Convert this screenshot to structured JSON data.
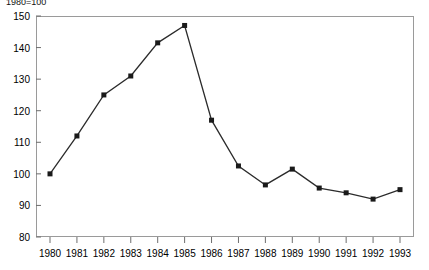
{
  "figure": {
    "index_note": "1980=100"
  },
  "chart_data": {
    "type": "line",
    "title": "",
    "subtitle": "",
    "annotations": [
      "1980=100"
    ],
    "xlabel": "",
    "ylabel": "",
    "categories": [
      "1980",
      "1981",
      "1982",
      "1983",
      "1984",
      "1985",
      "1986",
      "1987",
      "1988",
      "1989",
      "1990",
      "1991",
      "1992",
      "1993"
    ],
    "values": [
      100,
      112,
      125,
      131,
      141.5,
      147,
      117,
      102.5,
      96.5,
      101.5,
      95.5,
      94,
      92,
      95
    ],
    "x": [
      1980,
      1981,
      1982,
      1983,
      1984,
      1985,
      1986,
      1987,
      1988,
      1989,
      1990,
      1991,
      1992,
      1993
    ],
    "ylim": [
      80,
      150
    ],
    "yticks": [
      80,
      90,
      100,
      110,
      120,
      130,
      140,
      150
    ],
    "ytick_labels": [
      "80",
      "90",
      "100",
      "110",
      "120",
      "130",
      "140",
      "150"
    ],
    "xtick_labels": [
      "1980",
      "1981",
      "1982",
      "1983",
      "1984",
      "1985",
      "1986",
      "1987",
      "1988",
      "1989",
      "1990",
      "1991",
      "1992",
      "1993"
    ],
    "grid": false,
    "legend": null,
    "marker": "square",
    "marker_color": "#1a1a1a",
    "line_color": "#2b2b2b",
    "frame_color": "#9a9a9a"
  }
}
